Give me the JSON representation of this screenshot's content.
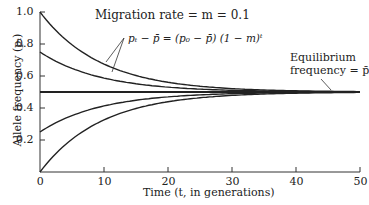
{
  "chart_data": {
    "type": "line",
    "title": "Migration rate = m = 0.1",
    "xlabel": "Time (t, in generations)",
    "ylabel": "Allele frequency (p_t)",
    "xlim": [
      0,
      50
    ],
    "ylim": [
      0,
      1.0
    ],
    "x_ticks": [
      "0",
      "10",
      "20",
      "30",
      "40",
      "50"
    ],
    "y_ticks": [
      "0.2",
      "0.4",
      "0.6",
      "0.8",
      "1.0"
    ],
    "equation": "p_t − p̄ = (p_0 − p̄) (1 − m)^t",
    "equilibrium_label": "Equilibrium frequency = p̄",
    "equilibrium": 0.5,
    "migration_rate": 0.1,
    "series": [
      {
        "name": "p0 = 1.0",
        "p0": 1.0
      },
      {
        "name": "p0 = 0.75",
        "p0": 0.75
      },
      {
        "name": "p0 = 0.5",
        "p0": 0.5
      },
      {
        "name": "p0 = 0.25",
        "p0": 0.25
      },
      {
        "name": "p0 = 0.0",
        "p0": 0.0
      }
    ]
  },
  "labels": {
    "title": "Migration rate = m = 0.1",
    "eq_line1": "Equilibrium",
    "eq_line2": "frequency = p̄",
    "xlabel": "Time (t, in generations)",
    "ylabel": "Allele frequency (pₜ)",
    "equation": "pₜ − p̄ = (p₀ − p̄) (1 − m)ᵗ"
  }
}
